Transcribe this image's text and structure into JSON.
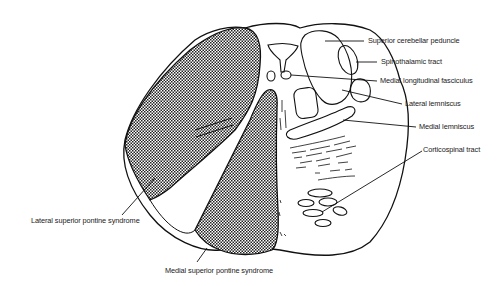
{
  "diagram": {
    "labels": {
      "superior_cerebellar_peduncle": "Superior cerebellar peduncle",
      "spinothalamic_tract": "Spinothalamic tract",
      "medial_longitudinal_fasciculus": "Medial longitudinal fasciculus",
      "lateral_lemniscus": "Lateral lemniscus",
      "medial_lemniscus": "Medial lemniscus",
      "corticospinal_tract": "Corticospinal tract",
      "lateral_superior_pontine_syndrome": "Lateral superior pontine syndrome",
      "medial_superior_pontine_syndrome": "Medial superior pontine syndrome"
    },
    "colors": {
      "line": "#111111",
      "lesion_fill": "#222222",
      "background": "#ffffff"
    }
  }
}
